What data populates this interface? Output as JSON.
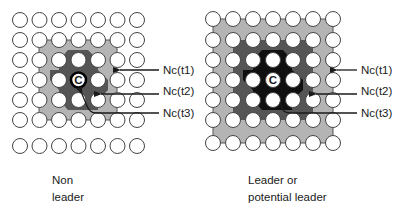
{
  "colors": {
    "light_gray": "#b4b4b4",
    "dark_gray": "#555555",
    "black": "#101010",
    "circle_fill": "#ffffff",
    "circle_stroke": "#444444"
  },
  "panels": [
    {
      "id": "non-leader",
      "caption_line1": "Non",
      "caption_line2": "leader",
      "center_label": "C",
      "labels": {
        "t1": "Nc(t1)",
        "t2": "Nc(t2)",
        "t3": "Nc(t3)"
      }
    },
    {
      "id": "leader",
      "caption_line1": "Leader or",
      "caption_line2": "potential leader",
      "center_label": "C",
      "labels": {
        "t1": "Nc(t1)",
        "t2": "Nc(t2)",
        "t3": "Nc(t3)"
      }
    }
  ]
}
